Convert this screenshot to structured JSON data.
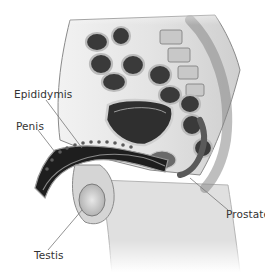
{
  "figure": {
    "labels": {
      "epididymis": "Epididymis",
      "penis": "Penis",
      "prostate": "Prostate",
      "testis": "Testis"
    },
    "colors": {
      "background": "#ffffff",
      "label_text": "#333333",
      "leader_line": "#777777",
      "tissue_light": "#d9d9d9",
      "tissue_mid": "#9a9a9a",
      "tissue_dark": "#2a2a2a"
    }
  }
}
